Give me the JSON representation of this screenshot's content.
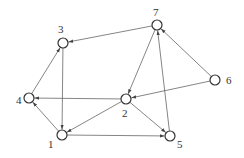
{
  "graph": {
    "nodes": [
      {
        "id": "1",
        "x": 62,
        "y": 135,
        "lx": 48,
        "ly": 148
      },
      {
        "id": "2",
        "x": 126,
        "y": 99,
        "lx": 122,
        "ly": 117
      },
      {
        "id": "3",
        "x": 63,
        "y": 43,
        "lx": 58,
        "ly": 33
      },
      {
        "id": "4",
        "x": 29,
        "y": 98,
        "lx": 16,
        "ly": 104
      },
      {
        "id": "5",
        "x": 170,
        "y": 136,
        "lx": 177,
        "ly": 148
      },
      {
        "id": "6",
        "x": 215,
        "y": 80,
        "lx": 226,
        "ly": 84
      },
      {
        "id": "7",
        "x": 157,
        "y": 25,
        "lx": 153,
        "ly": 16
      }
    ],
    "edges": [
      {
        "from": "7",
        "to": "3"
      },
      {
        "from": "3",
        "to": "1"
      },
      {
        "from": "4",
        "to": "3"
      },
      {
        "from": "1",
        "to": "4"
      },
      {
        "from": "2",
        "to": "4"
      },
      {
        "from": "2",
        "to": "1"
      },
      {
        "from": "1",
        "to": "5"
      },
      {
        "from": "2",
        "to": "5"
      },
      {
        "from": "5",
        "to": "7"
      },
      {
        "from": "7",
        "to": "2"
      },
      {
        "from": "6",
        "to": "7"
      },
      {
        "from": "6",
        "to": "2"
      }
    ]
  }
}
